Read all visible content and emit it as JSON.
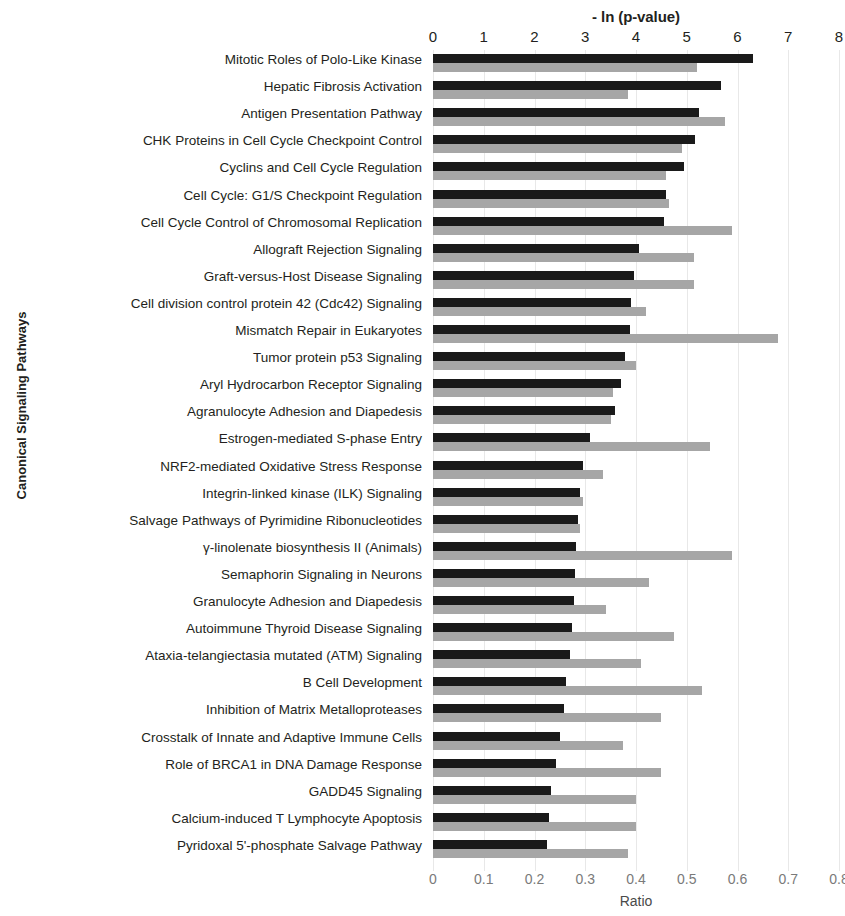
{
  "chart_data": {
    "type": "bar",
    "orientation": "horizontal",
    "title": "",
    "xlabel_top": "- ln (p-value)",
    "xlabel_bottom": "Ratio",
    "ylabel": "Canonical Signaling Pathways",
    "grid": true,
    "legend_position": "none",
    "xlim_top": [
      0,
      8
    ],
    "xlim_bottom": [
      0,
      0.8
    ],
    "xticks_top": [
      "0",
      "1",
      "2",
      "3",
      "4",
      "5",
      "6",
      "7",
      "8"
    ],
    "xticks_bottom": [
      "0",
      "0.1",
      "0.2",
      "0.3",
      "0.4",
      "0.5",
      "0.6",
      "0.7",
      "0.8"
    ],
    "series": [
      {
        "name": "- ln (p-value)",
        "color": "#1a1a1a",
        "axis": "top",
        "values": [
          6.3,
          5.67,
          5.25,
          5.17,
          4.94,
          4.6,
          4.55,
          4.05,
          3.97,
          3.9,
          3.88,
          3.78,
          3.7,
          3.58,
          3.1,
          2.95,
          2.9,
          2.85,
          2.82,
          2.8,
          2.78,
          2.74,
          2.7,
          2.62,
          2.58,
          2.5,
          2.42,
          2.33,
          2.28,
          2.25
        ]
      },
      {
        "name": "Ratio",
        "color": "#a6a6a6",
        "axis": "bottom",
        "values": [
          0.52,
          0.385,
          0.575,
          0.49,
          0.46,
          0.465,
          0.59,
          0.515,
          0.515,
          0.42,
          0.68,
          0.4,
          0.355,
          0.35,
          0.545,
          0.335,
          0.295,
          0.29,
          0.59,
          0.425,
          0.34,
          0.475,
          0.41,
          0.53,
          0.45,
          0.375,
          0.45,
          0.4,
          0.4,
          0.385
        ]
      }
    ],
    "categories": [
      "Mitotic Roles of Polo-Like Kinase",
      "Hepatic Fibrosis Activation",
      "Antigen Presentation Pathway",
      "CHK Proteins in Cell Cycle Checkpoint Control",
      "Cyclins and Cell Cycle Regulation",
      "Cell Cycle: G1/S Checkpoint Regulation",
      "Cell Cycle Control of Chromosomal Replication",
      "Allograft Rejection Signaling",
      "Graft-versus-Host Disease Signaling",
      "Cell division control protein 42 (Cdc42) Signaling",
      "Mismatch Repair in Eukaryotes",
      "Tumor protein p53 Signaling",
      "Aryl Hydrocarbon Receptor Signaling",
      "Agranulocyte Adhesion and Diapedesis",
      "Estrogen-mediated S-phase Entry",
      "NRF2-mediated Oxidative Stress Response",
      "Integrin-linked kinase (ILK) Signaling",
      "Salvage Pathways of Pyrimidine Ribonucleotides",
      "γ-linolenate biosynthesis II (Animals)",
      "Semaphorin Signaling in Neurons",
      "Granulocyte Adhesion and Diapedesis",
      "Autoimmune Thyroid Disease Signaling",
      "Ataxia-telangiectasia mutated (ATM) Signaling",
      "B Cell Development",
      "Inhibition of Matrix Metalloproteases",
      "Crosstalk of Innate and Adaptive Immune Cells",
      "Role of BRCA1 in DNA Damage Response",
      "GADD45 Signaling",
      "Calcium-induced T Lymphocyte Apoptosis",
      "Pyridoxal 5'-phosphate Salvage Pathway"
    ]
  }
}
